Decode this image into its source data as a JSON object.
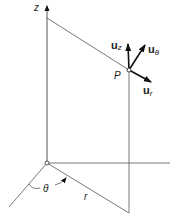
{
  "diagram": {
    "labels": {
      "z_axis": "z",
      "point": "P",
      "theta": "θ",
      "r": "r",
      "u": "u",
      "u_z_sub": "z",
      "u_theta_sub": "θ",
      "u_r_sub": "r"
    },
    "colors": {
      "line": "#555555",
      "arrow": "#111111",
      "text": "#222222"
    }
  }
}
